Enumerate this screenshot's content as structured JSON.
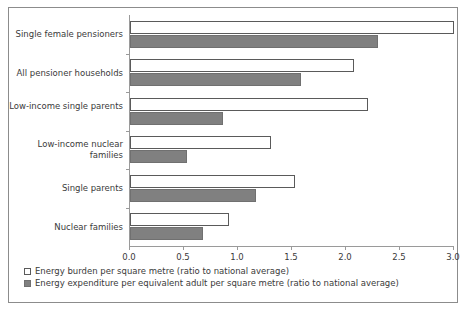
{
  "chart_data": {
    "type": "bar",
    "orientation": "horizontal",
    "title": "",
    "xlabel": "",
    "ylabel": "",
    "xlim": [
      0.0,
      3.0
    ],
    "xticks": [
      "0.0",
      "0.5",
      "1.0",
      "1.5",
      "2.0",
      "2.5",
      "3.0"
    ],
    "xtick_values": [
      0.0,
      0.5,
      1.0,
      1.5,
      2.0,
      2.5,
      3.0
    ],
    "grid": false,
    "legend_position": "below-axes-left",
    "categories": [
      "Single female pensioners",
      "All pensioner households",
      "Low-income single parents",
      "Low-income nuclear families",
      "Single parents",
      "Nuclear families"
    ],
    "series": [
      {
        "name": "Energy burden per square metre (ratio to national average)",
        "style": "open",
        "color": "#ffffff",
        "edge_color": "#5a5a5a",
        "values": [
          3.0,
          2.07,
          2.2,
          1.31,
          1.53,
          0.92
        ]
      },
      {
        "name": "Energy expenditure per equivalent adult per square metre (ratio to national average)",
        "style": "filled",
        "color": "#808080",
        "edge_color": "#707070",
        "values": [
          2.3,
          1.58,
          0.86,
          0.53,
          1.17,
          0.68
        ]
      }
    ]
  },
  "legend": {
    "items": [
      {
        "label": "Energy burden per square metre (ratio to national average)"
      },
      {
        "label": "Energy expenditure per equivalent adult per square metre (ratio to national average)"
      }
    ]
  },
  "colors": {
    "frame": "#8c8c8c",
    "axis": "#9a9a9a",
    "open_bar_fill": "#ffffff",
    "open_bar_edge": "#5a5a5a",
    "filled_bar_fill": "#808080",
    "filled_bar_edge": "#707070",
    "text": "#3a3a3a"
  }
}
